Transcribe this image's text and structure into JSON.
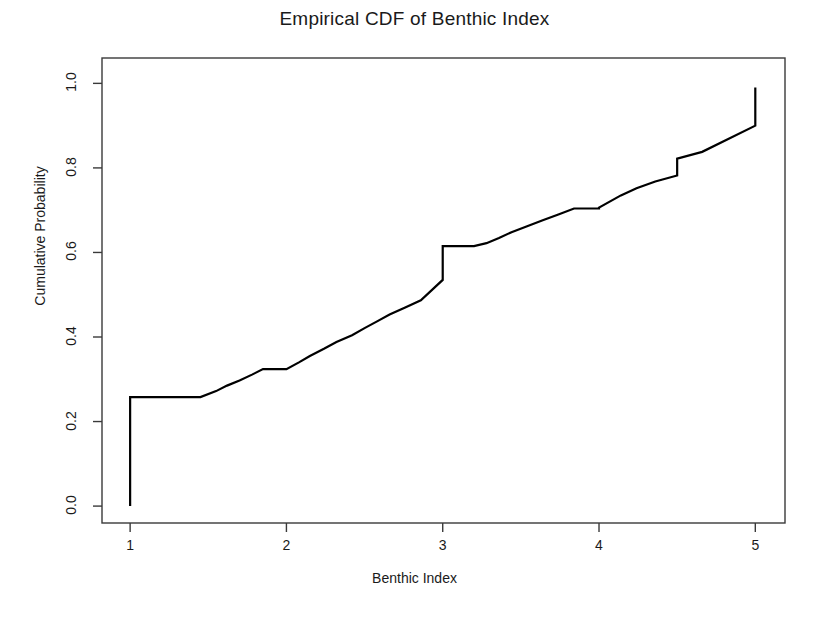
{
  "chart_data": {
    "type": "line",
    "subtype": "step-ecdf",
    "title": "Empirical CDF of Benthic Index",
    "xlabel": "Benthic Index",
    "ylabel": "Cumulative Probability",
    "xlim": [
      0.82,
      5.19
    ],
    "ylim": [
      -0.04,
      1.06
    ],
    "xticks": [
      1,
      2,
      3,
      4,
      5
    ],
    "xticklabels": [
      "1",
      "2",
      "3",
      "4",
      "5"
    ],
    "yticks": [
      0.0,
      0.2,
      0.4,
      0.6,
      0.8,
      1.0
    ],
    "yticklabels": [
      "0.0",
      "0.2",
      "0.4",
      "0.6",
      "0.8",
      "1.0"
    ],
    "grid": false,
    "legend": false,
    "line_color": "#000000",
    "line_width": 2.2,
    "box_color": "#3a3a3a",
    "series": [
      {
        "name": "ECDF",
        "x": [
          1.0,
          1.0,
          1.45,
          1.55,
          1.62,
          1.7,
          1.78,
          1.85,
          2.0,
          2.08,
          2.15,
          2.24,
          2.32,
          2.42,
          2.5,
          2.58,
          2.66,
          2.76,
          2.86,
          3.0,
          3.0,
          3.2,
          3.28,
          3.36,
          3.44,
          3.54,
          3.64,
          3.74,
          3.84,
          4.0,
          4.0,
          4.14,
          4.24,
          4.36,
          4.5,
          4.5,
          4.66,
          5.0,
          5.0
        ],
        "y": [
          0.0,
          0.258,
          0.258,
          0.272,
          0.285,
          0.297,
          0.311,
          0.324,
          0.324,
          0.34,
          0.355,
          0.372,
          0.388,
          0.404,
          0.421,
          0.437,
          0.453,
          0.47,
          0.487,
          0.535,
          0.615,
          0.615,
          0.622,
          0.634,
          0.648,
          0.662,
          0.676,
          0.69,
          0.704,
          0.704,
          0.706,
          0.735,
          0.752,
          0.768,
          0.782,
          0.822,
          0.838,
          0.9,
          0.99
        ]
      }
    ],
    "steps": [
      {
        "x_start": 1.0,
        "x_end": 1.45,
        "y": 0.258
      },
      {
        "x_start": 1.45,
        "x_end": 1.55,
        "y": 0.272
      },
      {
        "x_start": 1.55,
        "x_end": 1.62,
        "y": 0.285
      },
      {
        "x_start": 1.62,
        "x_end": 1.7,
        "y": 0.297
      },
      {
        "x_start": 1.7,
        "x_end": 1.78,
        "y": 0.311
      },
      {
        "x_start": 1.78,
        "x_end": 2.0,
        "y": 0.324
      },
      {
        "x_start": 2.0,
        "x_end": 2.08,
        "y": 0.34
      },
      {
        "x_start": 2.08,
        "x_end": 2.16,
        "y": 0.355
      },
      {
        "x_start": 2.16,
        "x_end": 2.24,
        "y": 0.372
      },
      {
        "x_start": 2.24,
        "x_end": 2.33,
        "y": 0.388
      },
      {
        "x_start": 2.33,
        "x_end": 2.42,
        "y": 0.404
      },
      {
        "x_start": 2.42,
        "x_end": 2.51,
        "y": 0.421
      },
      {
        "x_start": 2.51,
        "x_end": 2.6,
        "y": 0.437
      },
      {
        "x_start": 2.6,
        "x_end": 2.7,
        "y": 0.453
      },
      {
        "x_start": 2.7,
        "x_end": 2.8,
        "y": 0.47
      },
      {
        "x_start": 2.8,
        "x_end": 3.0,
        "y": 0.535
      },
      {
        "x_start": 3.0,
        "x_end": 3.26,
        "y": 0.615
      },
      {
        "x_start": 3.26,
        "x_end": 3.36,
        "y": 0.624
      },
      {
        "x_start": 3.36,
        "x_end": 3.46,
        "y": 0.64
      },
      {
        "x_start": 3.46,
        "x_end": 3.58,
        "y": 0.656
      },
      {
        "x_start": 3.58,
        "x_end": 3.7,
        "y": 0.672
      },
      {
        "x_start": 3.7,
        "x_end": 3.84,
        "y": 0.688
      },
      {
        "x_start": 3.84,
        "x_end": 4.0,
        "y": 0.704
      },
      {
        "x_start": 4.0,
        "x_end": 4.16,
        "y": 0.706
      },
      {
        "x_start": 4.16,
        "x_end": 4.28,
        "y": 0.736
      },
      {
        "x_start": 4.28,
        "x_end": 4.42,
        "y": 0.754
      },
      {
        "x_start": 4.42,
        "x_end": 4.52,
        "y": 0.782
      },
      {
        "x_start": 4.52,
        "x_end": 4.7,
        "y": 0.824
      },
      {
        "x_start": 4.7,
        "x_end": 5.0,
        "y": 0.9
      },
      {
        "x_start": 5.0,
        "x_end": 5.0,
        "y": 0.99
      }
    ],
    "notes": {
      "initial_jump": "Vertical rise at x=1 from 0.00 to 0.258",
      "major_jump_at_3": "Step from 0.535 to 0.615 at x=3",
      "final_jump_at_5": "Step from 0.900 to 0.990 at x=5"
    }
  }
}
